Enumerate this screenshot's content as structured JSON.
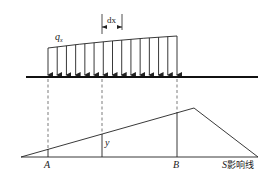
{
  "diagram": {
    "title": "",
    "load": {
      "label": "q",
      "label_sub": "x",
      "arrow_count": 15,
      "x_start": 48,
      "x_end": 177,
      "top_y_start": 48,
      "top_y_end": 36
    },
    "dx_label": "dx",
    "beam": {
      "x1": 26,
      "x2": 258,
      "y": 77
    },
    "influence_line": {
      "label_s": "S",
      "label_text": "影响线",
      "baseline_y": 157,
      "left_x": 21,
      "right_x": 258,
      "peak": {
        "x": 194,
        "y": 108
      }
    },
    "points": [
      {
        "name": "A",
        "x": 48
      },
      {
        "name": "B",
        "x": 177
      }
    ],
    "ordinate_label": "y",
    "ordinate_x": 102,
    "colors": {
      "line": "#222222",
      "background": "#ffffff"
    }
  }
}
